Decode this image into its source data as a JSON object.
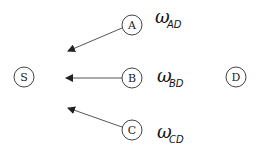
{
  "diagram": {
    "nodes": [
      {
        "id": "S",
        "label": "S",
        "cx": 24,
        "cy": 77
      },
      {
        "id": "A",
        "label": "A",
        "cx": 132,
        "cy": 25
      },
      {
        "id": "B",
        "label": "B",
        "cx": 132,
        "cy": 78
      },
      {
        "id": "C",
        "label": "C",
        "cx": 132,
        "cy": 130
      },
      {
        "id": "D",
        "label": "D",
        "cx": 236,
        "cy": 77
      }
    ],
    "edges": [
      {
        "from": "A",
        "to": "S",
        "label": "ω",
        "sub": "AD"
      },
      {
        "from": "B",
        "to": "S",
        "label": "ω",
        "sub": "BD"
      },
      {
        "from": "C",
        "to": "S",
        "label": "ω",
        "sub": "CD"
      }
    ],
    "colors": {
      "stroke": "#333333",
      "background": "#ffffff"
    }
  }
}
